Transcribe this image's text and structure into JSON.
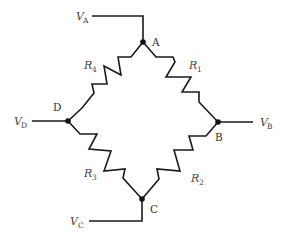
{
  "diagram": {
    "type": "wheatstone-bridge",
    "nodes": {
      "A": {
        "label": "A",
        "voltage_symbol": "V",
        "voltage_sub": "A"
      },
      "B": {
        "label": "B",
        "voltage_symbol": "V",
        "voltage_sub": "B"
      },
      "C": {
        "label": "C",
        "voltage_symbol": "V",
        "voltage_sub": "C"
      },
      "D": {
        "label": "D",
        "voltage_symbol": "V",
        "voltage_sub": "D"
      }
    },
    "resistors": {
      "R1": {
        "symbol": "R",
        "sub": "1",
        "between": "A-B"
      },
      "R2": {
        "symbol": "R",
        "sub": "2",
        "between": "B-C"
      },
      "R3": {
        "symbol": "R",
        "sub": "3",
        "between": "C-D"
      },
      "R4": {
        "symbol": "R",
        "sub": "4",
        "between": "D-A"
      }
    },
    "colors": {
      "wire": "#1a1a1a",
      "node": "#111111",
      "label": "#444444",
      "background": "#ffffff"
    }
  }
}
